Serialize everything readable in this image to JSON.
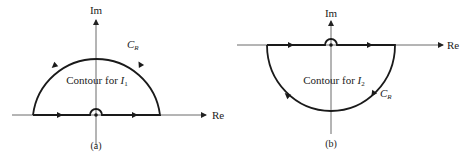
{
  "figure": {
    "panels": [
      {
        "id": "a",
        "caption": "(a)",
        "im_label": "Im",
        "re_label": "Re",
        "arc_label_main": "C",
        "arc_label_sub": "R",
        "contour_text": "Contour for ",
        "integral_main": "I",
        "integral_sub": "1",
        "orientation": "upper half-plane, counterclockwise, indented above origin"
      },
      {
        "id": "b",
        "caption": "(b)",
        "im_label": "Im",
        "re_label": "Re",
        "arc_label_main": "C",
        "arc_label_sub": "R",
        "contour_text": "Contour for ",
        "integral_main": "I",
        "integral_sub": "2",
        "orientation": "lower half-plane, clockwise, indented above origin"
      }
    ],
    "colors": {
      "stroke": "#1a1a1a",
      "axis": "#333333",
      "text": "#222222"
    }
  }
}
